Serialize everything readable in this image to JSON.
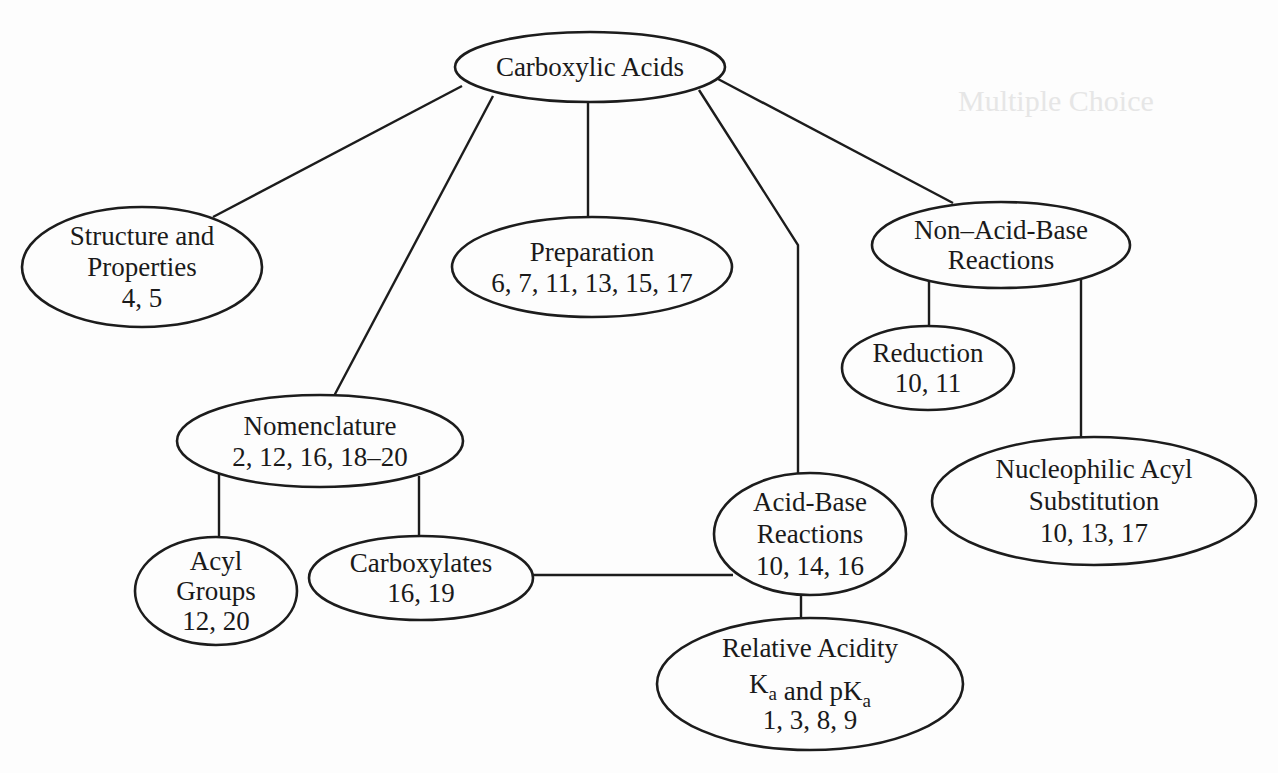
{
  "diagram": {
    "nodes": [
      {
        "id": "carboxylic-acids",
        "lines": [
          "Carboxylic Acids"
        ]
      },
      {
        "id": "structure-properties",
        "lines": [
          "Structure and",
          "Properties",
          "4, 5"
        ]
      },
      {
        "id": "preparation",
        "lines": [
          "Preparation",
          "6, 7, 11, 13, 15, 17"
        ]
      },
      {
        "id": "non-acid-base-reactions",
        "lines": [
          "Non–Acid-Base",
          "Reactions"
        ]
      },
      {
        "id": "reduction",
        "lines": [
          "Reduction",
          "10, 11"
        ]
      },
      {
        "id": "nomenclature",
        "lines": [
          "Nomenclature",
          "2, 12, 16, 18–20"
        ]
      },
      {
        "id": "acyl-groups",
        "lines": [
          "Acyl",
          "Groups",
          "12, 20"
        ]
      },
      {
        "id": "carboxylates",
        "lines": [
          "Carboxylates",
          "16, 19"
        ]
      },
      {
        "id": "acid-base-reactions",
        "lines": [
          "Acid-Base",
          "Reactions",
          "10, 14, 16"
        ]
      },
      {
        "id": "nucleophilic-acyl-substitution",
        "lines": [
          "Nucleophilic Acyl",
          "Substitution",
          "10, 13, 17"
        ]
      },
      {
        "id": "relative-acidity",
        "lines": [
          "Relative Acidity",
          [
            [
              "K",
              "a"
            ],
            [
              " and pK",
              "a"
            ]
          ],
          "1, 3, 8, 9"
        ]
      }
    ],
    "edges": [
      {
        "from": "carboxylic-acids",
        "to": "structure-properties"
      },
      {
        "from": "carboxylic-acids",
        "to": "nomenclature"
      },
      {
        "from": "carboxylic-acids",
        "to": "preparation"
      },
      {
        "from": "carboxylic-acids",
        "to": "acid-base-reactions"
      },
      {
        "from": "carboxylic-acids",
        "to": "non-acid-base-reactions"
      },
      {
        "from": "non-acid-base-reactions",
        "to": "reduction"
      },
      {
        "from": "non-acid-base-reactions",
        "to": "nucleophilic-acyl-substitution"
      },
      {
        "from": "nomenclature",
        "to": "acyl-groups"
      },
      {
        "from": "nomenclature",
        "to": "carboxylates"
      },
      {
        "from": "carboxylates",
        "to": "acid-base-reactions"
      },
      {
        "from": "acid-base-reactions",
        "to": "relative-acidity"
      }
    ]
  },
  "background_bleed_through": [
    "Multiple Choice"
  ]
}
